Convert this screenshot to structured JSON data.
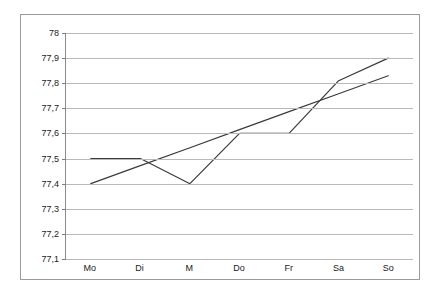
{
  "chart_data": {
    "type": "line",
    "title": "",
    "subtitle": "",
    "xlabel": "",
    "ylabel": "",
    "categories": [
      "Mo",
      "Di",
      "M",
      "Do",
      "Fr",
      "Sa",
      "So"
    ],
    "ylim": [
      77.1,
      78.0
    ],
    "ytick_labels": [
      "78",
      "77,9",
      "77,8",
      "77,7",
      "77,6",
      "77,5",
      "77,4",
      "77,3",
      "77,2",
      "77,1"
    ],
    "ytick_values": [
      78.0,
      77.9,
      77.8,
      77.7,
      77.6,
      77.5,
      77.4,
      77.3,
      77.2,
      77.1
    ],
    "grid": "horizontal",
    "legend": "none",
    "decimal_separator": ",",
    "series": [
      {
        "name": "data-series",
        "values": [
          77.5,
          77.5,
          77.4,
          77.6,
          77.6,
          77.81,
          77.9
        ],
        "color": "#3a3a3a"
      },
      {
        "name": "trend-line",
        "values": [
          77.4,
          77.472,
          77.543,
          77.615,
          77.687,
          77.758,
          77.83
        ],
        "color": "#3a3a3a"
      }
    ]
  },
  "style": {
    "background": "#ffffff",
    "frame_border": "#9a9a9a",
    "gridline_color": "#b9b9b9",
    "axis_color": "#8c8c8c",
    "text_color": "#1a1a1a"
  }
}
